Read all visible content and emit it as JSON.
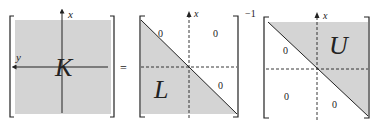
{
  "equation": {
    "lhs": {
      "label": "K",
      "axis_x": "x",
      "axis_y": "y"
    },
    "equals": "=",
    "factor_l": {
      "label": "L",
      "axis_x": "x",
      "zeros": [
        "0",
        "0",
        "0"
      ]
    },
    "exponent": "−1",
    "factor_u": {
      "label": "U",
      "axis_x": "x",
      "zeros": [
        "0",
        "0",
        "0"
      ]
    }
  },
  "colors": {
    "fill": "#d4d4d4",
    "line": "#222222"
  }
}
